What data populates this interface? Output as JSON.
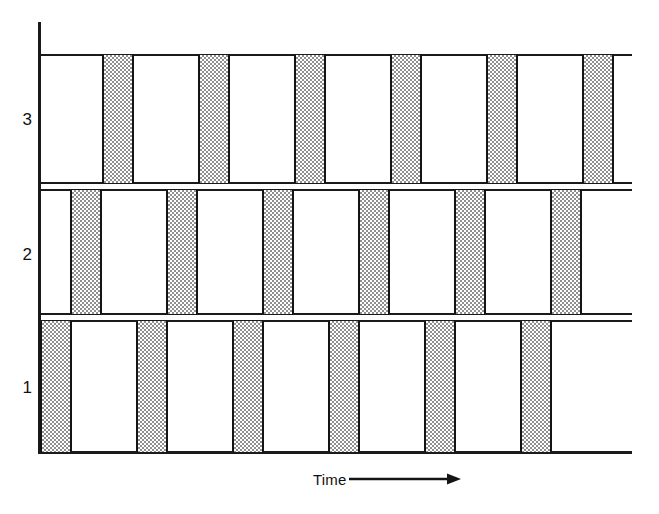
{
  "figure": {
    "kind": "timeline-raster-diagram",
    "background_color": "#ffffff",
    "axis_color": "#1a1a1a",
    "bar_fill_color": "#b8b8b8",
    "bar_border_color": "#141414"
  },
  "axes": {
    "x_label": "Time",
    "x_arrow_glyph": "⟶",
    "y_tick_labels": [
      "3",
      "2",
      "1"
    ]
  },
  "chart_data": {
    "type": "bar",
    "title": "",
    "xlabel": "Time",
    "ylabel": "",
    "grid": false,
    "legend": false,
    "orientation": "horizontal-rows",
    "categories": [
      "3",
      "2",
      "1"
    ],
    "series": [
      {
        "name": "3",
        "row_index": 0,
        "bar_count": 6,
        "bar_width_px": 32,
        "bar_period_px": 96,
        "bar_starts_px": [
          62,
          158,
          254,
          350,
          446,
          542
        ],
        "row_top_px": 54,
        "row_bottom_px": 184
      },
      {
        "name": "2",
        "row_index": 1,
        "bar_count": 6,
        "bar_width_px": 32,
        "bar_period_px": 96,
        "bar_starts_px": [
          30,
          126,
          222,
          318,
          414,
          510
        ],
        "row_top_px": 189,
        "row_bottom_px": 315
      },
      {
        "name": "1",
        "row_index": 2,
        "bar_count": 6,
        "bar_width_px": 32,
        "bar_period_px": 96,
        "bar_starts_px": [
          0,
          96,
          192,
          288,
          384,
          480
        ],
        "row_top_px": 320,
        "row_bottom_px": 453
      }
    ]
  }
}
